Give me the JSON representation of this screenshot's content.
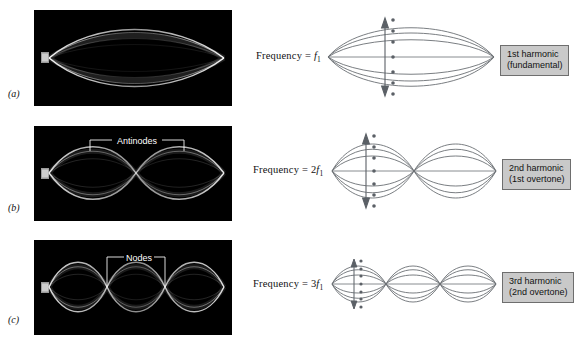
{
  "figure": {
    "background_color": "#ffffff",
    "photo_background": "#000000",
    "wave_color": "#6b6f74",
    "label_box_fill": "#c9c9c9",
    "label_box_border": "#6e6e6e"
  },
  "rows": [
    {
      "panel_letter": "(a)",
      "photo_caption": "",
      "photo_annotation": "",
      "frequency_prefix": "Frequency = ",
      "frequency_multiplier": "",
      "frequency_symbol": "f",
      "frequency_subscript": "1",
      "harmonic_name": "1st harmonic",
      "harmonic_overtone": "(fundamental)",
      "loops": 1,
      "nodes": 2,
      "antinodes": 1
    },
    {
      "panel_letter": "(b)",
      "photo_caption": "",
      "photo_annotation": "Antinodes",
      "frequency_prefix": "Frequency = ",
      "frequency_multiplier": "2",
      "frequency_symbol": "f",
      "frequency_subscript": "1",
      "harmonic_name": "2nd harmonic",
      "harmonic_overtone": "(1st overtone)",
      "loops": 2,
      "nodes": 3,
      "antinodes": 2
    },
    {
      "panel_letter": "(c)",
      "photo_caption": "",
      "photo_annotation": "Nodes",
      "frequency_prefix": "Frequency = ",
      "frequency_multiplier": "3",
      "frequency_symbol": "f",
      "frequency_subscript": "1",
      "harmonic_name": "3rd harmonic",
      "harmonic_overtone": "(2nd overtone)",
      "loops": 3,
      "nodes": 4,
      "antinodes": 3
    }
  ],
  "amplitude_marker": {
    "arrow": "double-headed vertical arrow",
    "dot_count": 7
  }
}
